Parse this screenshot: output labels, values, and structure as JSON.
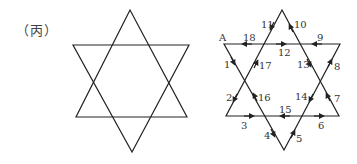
{
  "caption": "（丙）",
  "colors": {
    "line": "#222222",
    "text": "#333333",
    "background": "#ffffff"
  },
  "left_star": {
    "description": "Plain hexagram (Star of David) without labels",
    "up_triangle": [
      [
        130,
        10
      ],
      [
        76,
        117
      ],
      [
        187,
        117
      ]
    ],
    "down_triangle": [
      [
        73,
        45
      ],
      [
        189,
        45
      ],
      [
        132,
        152
      ]
    ]
  },
  "right_star": {
    "description": "Hexagram with directed edges numbered 1-18 starting from vertex A",
    "vertex_label": "A",
    "up_triangle": [
      [
        282,
        10
      ],
      [
        226,
        116
      ],
      [
        339,
        116
      ]
    ],
    "down_triangle": [
      [
        224,
        44
      ],
      [
        340,
        44
      ],
      [
        284,
        150
      ]
    ],
    "edge_labels": [
      {
        "n": "1",
        "x": 226,
        "y": 66
      },
      {
        "n": "2",
        "x": 228,
        "y": 100
      },
      {
        "n": "3",
        "x": 242,
        "y": 128
      },
      {
        "n": "4",
        "x": 266,
        "y": 137
      },
      {
        "n": "5",
        "x": 294,
        "y": 141
      },
      {
        "n": "6",
        "x": 318,
        "y": 128
      },
      {
        "n": "7",
        "x": 333,
        "y": 101
      },
      {
        "n": "8",
        "x": 334,
        "y": 69
      },
      {
        "n": "9",
        "x": 319,
        "y": 41
      },
      {
        "n": "10",
        "x": 295,
        "y": 27
      },
      {
        "n": "11",
        "x": 263,
        "y": 27
      },
      {
        "n": "12",
        "x": 283,
        "y": 55
      },
      {
        "n": "13",
        "x": 301,
        "y": 67
      },
      {
        "n": "14",
        "x": 297,
        "y": 99
      },
      {
        "n": "15",
        "x": 282,
        "y": 112
      },
      {
        "n": "16",
        "x": 259,
        "y": 101
      },
      {
        "n": "17",
        "x": 259,
        "y": 68
      },
      {
        "n": "18",
        "x": 248,
        "y": 41
      }
    ]
  }
}
